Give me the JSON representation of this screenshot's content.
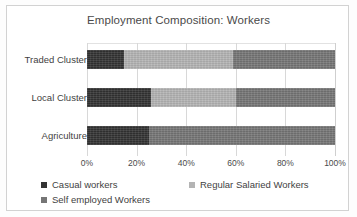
{
  "chart_data": {
    "type": "bar",
    "orientation": "horizontal",
    "stacked": true,
    "stacked_mode": "percent",
    "title": "Employment Composition: Workers",
    "xlabel": "",
    "ylabel": "",
    "categories": [
      "Traded Cluster",
      "Local Cluster",
      "Agriculture"
    ],
    "series": [
      {
        "name": "Casual workers",
        "color": "#333333",
        "values": [
          15,
          26,
          25
        ]
      },
      {
        "name": "Regular Salaried Workers",
        "color": "#b4b4b4",
        "values": [
          44,
          34,
          0
        ]
      },
      {
        "name": "Self employed Workers",
        "color": "#767676",
        "values": [
          41,
          40,
          75
        ]
      }
    ],
    "xlim": [
      0,
      100
    ],
    "xticks": [
      0,
      20,
      40,
      60,
      80,
      100
    ],
    "xticklabels": [
      "0%",
      "20%",
      "40%",
      "60%",
      "80%",
      "100%"
    ],
    "grid": true,
    "grid_axis": "x",
    "legend_position": "bottom"
  },
  "style": {
    "frame_color": "#d2d2d2",
    "grid_color": "#d8d8d8",
    "text_color": "#3f3f3f",
    "title_color": "#4a4a4a",
    "plot_background": "#ffffff",
    "page_background": "#fdfdfd"
  }
}
